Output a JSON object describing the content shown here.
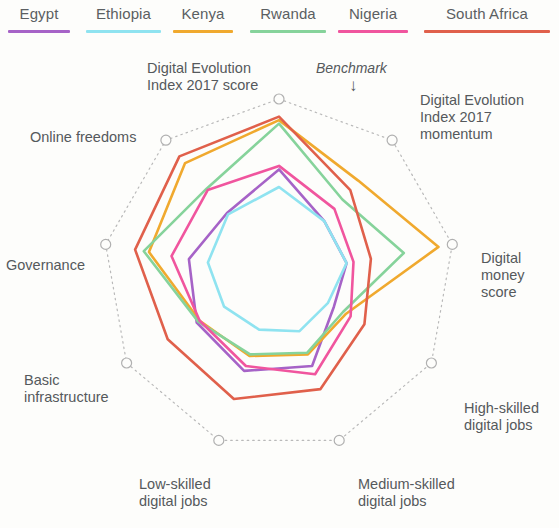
{
  "legend": {
    "items": [
      {
        "label": "Egypt",
        "color": "#a663c7"
      },
      {
        "label": "Ethiopia",
        "color": "#8fe3f0"
      },
      {
        "label": "Kenya",
        "color": "#f0a92e"
      },
      {
        "label": "Rwanda",
        "color": "#86d39b"
      },
      {
        "label": "Nigeria",
        "color": "#f0559e"
      },
      {
        "label": "South Africa",
        "color": "#e0604b"
      }
    ]
  },
  "annotations": {
    "benchmark_label": "Benchmark",
    "benchmark_arrow": "↓"
  },
  "chart_data": {
    "type": "radar",
    "title": "",
    "categories": [
      "Digital Evolution Index 2017 score",
      "Digital Evolution Index 2017 momentum",
      "Digital money score",
      "High-skilled digital jobs",
      "Medium-skilled digital jobs",
      "Low-skilled digital jobs",
      "Basic infrastructure",
      "Governance",
      "Online freedoms"
    ],
    "category_lines": [
      [
        "Digital Evolution",
        "Index 2017 score"
      ],
      [
        "Digital Evolution",
        "Index 2017",
        "momentum"
      ],
      [
        "Digital",
        "money",
        "score"
      ],
      [
        "High-skilled",
        "digital jobs"
      ],
      [
        "Medium-skilled",
        "digital jobs"
      ],
      [
        "Low-skilled",
        "digital jobs"
      ],
      [
        "Basic",
        "infrastructure"
      ],
      [
        "Governance"
      ],
      [
        "Online freedoms"
      ]
    ],
    "rlim": [
      0,
      1
    ],
    "benchmark": 1.0,
    "benchmark_shape": "dotted-nonagon",
    "grid": false,
    "legend_position": "top",
    "series": [
      {
        "name": "Egypt",
        "color": "#a663c7",
        "values": [
          0.6,
          0.4,
          0.39,
          0.36,
          0.55,
          0.58,
          0.54,
          0.52,
          0.46
        ]
      },
      {
        "name": "Ethiopia",
        "color": "#8fe3f0",
        "values": [
          0.5,
          0.4,
          0.39,
          0.32,
          0.34,
          0.33,
          0.36,
          0.41,
          0.45
        ]
      },
      {
        "name": "Kenya",
        "color": "#f0a92e",
        "values": [
          0.88,
          0.7,
          0.92,
          0.44,
          0.48,
          0.49,
          0.52,
          0.75,
          0.83
        ]
      },
      {
        "name": "Rwanda",
        "color": "#86d39b",
        "values": [
          0.86,
          0.56,
          0.72,
          0.42,
          0.47,
          0.48,
          0.53,
          0.78,
          0.64
        ]
      },
      {
        "name": "Nigeria",
        "color": "#f0559e",
        "values": [
          0.62,
          0.49,
          0.43,
          0.47,
          0.6,
          0.55,
          0.52,
          0.62,
          0.63
        ]
      },
      {
        "name": "South Africa",
        "color": "#e0604b",
        "values": [
          0.9,
          0.63,
          0.53,
          0.56,
          0.69,
          0.75,
          0.73,
          0.83,
          0.88
        ]
      }
    ]
  }
}
